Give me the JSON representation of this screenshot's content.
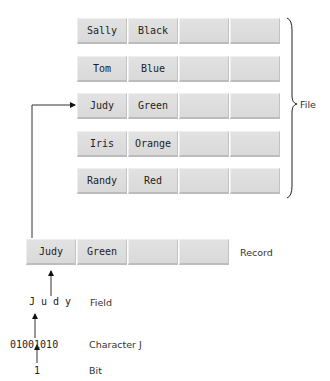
{
  "file": {
    "label": "File",
    "records": [
      {
        "name": "Sally",
        "color": "Black"
      },
      {
        "name": "Tom",
        "color": "Blue"
      },
      {
        "name": "Judy",
        "color": "Green"
      },
      {
        "name": "Iris",
        "color": "Orange"
      },
      {
        "name": "Randy",
        "color": "Red"
      }
    ]
  },
  "record": {
    "label": "Record",
    "name": "Judy",
    "color": "Green"
  },
  "field": {
    "label": "Field",
    "value": "J u d y"
  },
  "character": {
    "label": "Character J",
    "value": "01001010"
  },
  "bit": {
    "label": "Bit",
    "value": "1"
  }
}
